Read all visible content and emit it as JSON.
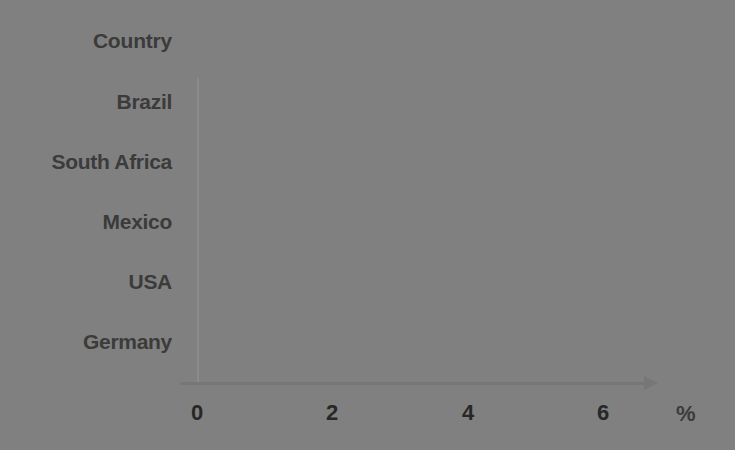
{
  "chart_data": {
    "type": "bar",
    "orientation": "horizontal",
    "title": "",
    "xlabel": "%",
    "ylabel": "Country",
    "categories": [
      "Brazil",
      "South Africa",
      "Mexico",
      "USA",
      "Germany"
    ],
    "values": [
      5.6,
      5.3,
      4.65,
      4.0,
      3.0
    ],
    "series": [
      {
        "name": "",
        "values": [
          5.6,
          5.3,
          4.65,
          4.0,
          3.0
        ]
      }
    ],
    "xlim": [
      0,
      7
    ],
    "ylim": null,
    "x_ticks": [
      0,
      2,
      4,
      6
    ],
    "x_tick_labels": [
      "0",
      "2",
      "4",
      "6"
    ],
    "grid": false,
    "legend": false,
    "legend_position": "none",
    "bar_color": "#808080",
    "axis_color": "#777777",
    "text_color": "#3b3b3b",
    "background_color": "#ffffff",
    "annotations": []
  },
  "axis": {
    "category_axis_title": "Country",
    "value_axis_unit": "%",
    "ticks": [
      {
        "label": "0",
        "value": 0
      },
      {
        "label": "2",
        "value": 2
      },
      {
        "label": "4",
        "value": 4
      },
      {
        "label": "6",
        "value": 6
      }
    ]
  },
  "bars": [
    {
      "label": "Brazil",
      "value": 5.6
    },
    {
      "label": "South Africa",
      "value": 5.3
    },
    {
      "label": "Mexico",
      "value": 4.65
    },
    {
      "label": "USA",
      "value": 4.0
    },
    {
      "label": "Germany",
      "value": 3.0
    }
  ]
}
